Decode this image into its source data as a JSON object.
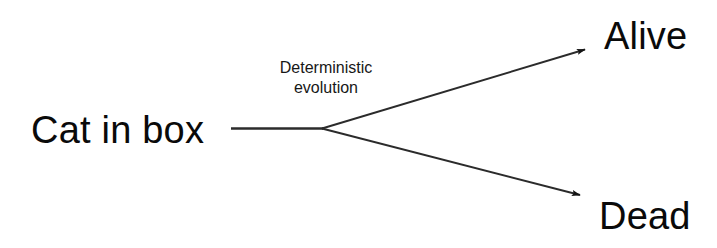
{
  "diagram": {
    "type": "branching-process-diagram",
    "background_color": "#ffffff",
    "stroke_color": "#2b2b2b",
    "text_color": "#0a0a0a",
    "nodes": {
      "source_label": "Cat in box",
      "outcome_top_label": "Alive",
      "outcome_bottom_label": "Dead"
    },
    "edges": {
      "process_label_line1": "Deterministic",
      "process_label_line2": "evolution"
    }
  }
}
